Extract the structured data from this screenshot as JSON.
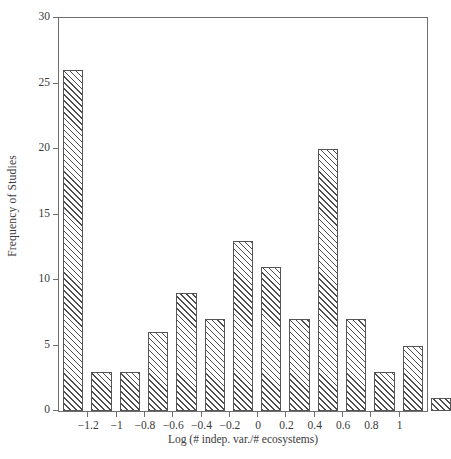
{
  "chart_data": {
    "type": "bar",
    "title": "",
    "subtitle": "",
    "xlabel": "Log (# indep. var./# ecosystems)",
    "ylabel": "Frequency of Studies",
    "xlim": [
      -1.4,
      1.2
    ],
    "ylim": [
      0,
      30
    ],
    "bin_width": 0.2,
    "grid": false,
    "legend": null,
    "legend_position": "none",
    "annotations": [],
    "xticks": [
      -1.2,
      -1,
      -0.8,
      -0.6,
      -0.4,
      -0.2,
      0,
      0.2,
      0.4,
      0.6,
      0.8,
      1
    ],
    "xtick_labels": [
      "-1.2",
      "-1",
      "-0.8",
      "-0.6",
      "-0.4",
      "-0.2",
      "0",
      "0.2",
      "0.4",
      "0.6",
      "0.8",
      "1"
    ],
    "yticks": [
      0,
      5,
      10,
      15,
      20,
      25,
      30
    ],
    "ytick_labels": [
      "0",
      "5",
      "10",
      "15",
      "20",
      "25",
      "30"
    ],
    "bin_centers": [
      -1.3,
      -1.1,
      -0.9,
      -0.7,
      -0.5,
      -0.3,
      -0.1,
      0.1,
      0.3,
      0.5,
      0.7,
      0.9,
      1.1
    ],
    "bin_edges": [
      -1.4,
      -1.2,
      -1.0,
      -0.8,
      -0.6,
      -0.4,
      -0.2,
      0.0,
      0.2,
      0.4,
      0.6,
      0.8,
      1.0,
      1.2
    ],
    "categories": [
      "-1.4 to -1.2",
      "-1.2 to -1.0",
      "-1.0 to -0.8",
      "-0.8 to -0.6",
      "-0.6 to -0.4",
      "-0.4 to -0.2",
      "-0.2 to 0.0",
      "0.0 to 0.2",
      "0.2 to 0.4",
      "0.4 to 0.6",
      "0.6 to 0.8",
      "0.8 to 1.0",
      "1.0 to 1.2"
    ],
    "values": [
      26,
      3,
      3,
      6,
      9,
      7,
      13,
      11,
      7,
      20,
      7,
      3,
      5
    ],
    "extra_bar": {
      "center": 1.3,
      "value": 1,
      "label": "1.2 to 1.4"
    },
    "bar_style": {
      "fill": "#ffffff",
      "hatch": "///",
      "edge_color": "#555555"
    }
  }
}
